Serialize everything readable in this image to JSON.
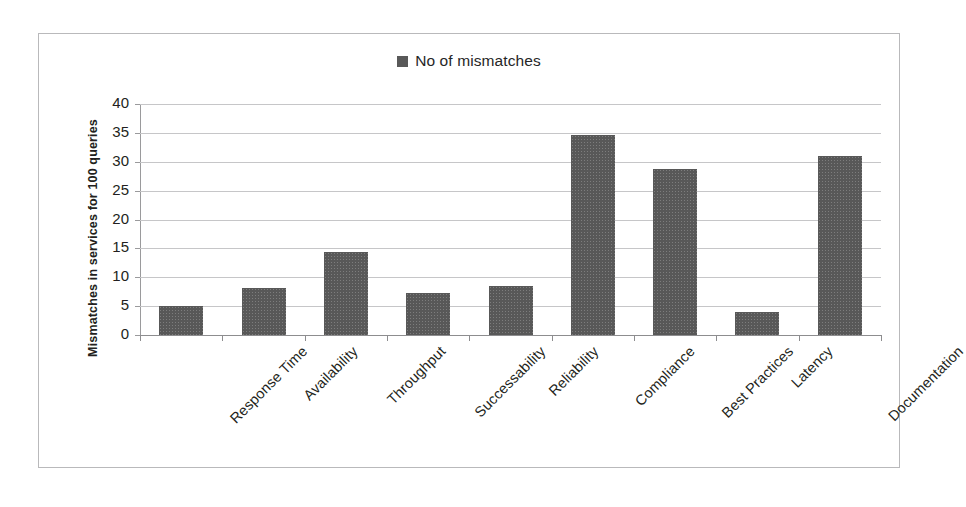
{
  "chart_data": {
    "type": "bar",
    "title": "",
    "subtitle": "",
    "xlabel": "",
    "ylabel": "Mismatches in services for 100 queries",
    "ylim": [
      0,
      40
    ],
    "ytick_step": 5,
    "yticks": [
      40,
      35,
      30,
      25,
      20,
      15,
      10,
      5,
      0
    ],
    "grid": true,
    "legend_position": "top-center",
    "categories": [
      "Response Time",
      "Availability",
      "Throughput",
      "Successability",
      "Reliability",
      "Compliance",
      "Best Practices",
      "Latency",
      "Documentation"
    ],
    "series": [
      {
        "name": "No of mismatches",
        "color": "#585858",
        "values": [
          5.1,
          8.2,
          14.3,
          7.3,
          8.5,
          34.7,
          28.7,
          3.9,
          31.0
        ]
      }
    ]
  },
  "legend": {
    "entries": [
      {
        "label": "No of mismatches",
        "color": "#585858"
      }
    ]
  },
  "axes": {
    "y_title": "Mismatches in services for 100 queries"
  }
}
